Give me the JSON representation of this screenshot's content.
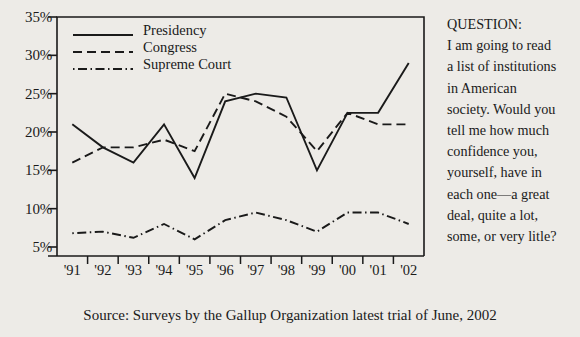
{
  "chart_data": {
    "type": "line",
    "title": "",
    "xlabel": "",
    "ylabel": "",
    "categories": [
      "'91",
      "'92",
      "'93",
      "'94",
      "'95",
      "'96",
      "'97",
      "'98",
      "'99",
      "'00",
      "'01",
      "'02"
    ],
    "ylim": [
      0,
      35
    ],
    "ytick_values": [
      5,
      10,
      15,
      20,
      25,
      30,
      35
    ],
    "ytick_labels": [
      "5%",
      "10%",
      "15%",
      "20%",
      "25%",
      "30%",
      "35%"
    ],
    "grid": false,
    "legend_position": "top-left",
    "series": [
      {
        "name": "Presidency",
        "style": "solid",
        "values": [
          21,
          18,
          16,
          21,
          14,
          24,
          25,
          24.5,
          15,
          22.5,
          22.5,
          29
        ]
      },
      {
        "name": "Congress",
        "style": "dashed",
        "values": [
          16,
          18,
          18,
          19,
          17.5,
          25,
          24,
          22,
          17.5,
          22.5,
          21,
          21
        ]
      },
      {
        "name": "Supreme Court",
        "style": "dash-dot",
        "values": [
          6.8,
          7,
          6.2,
          8,
          6,
          8.5,
          9.5,
          8.5,
          7,
          9.5,
          9.5,
          8
        ]
      }
    ]
  },
  "question": {
    "heading": "QUESTION:",
    "lines": [
      "I am going to read",
      "a list of institutions",
      "in American",
      "society. Would you",
      "tell me how much",
      "confidence you,",
      "yourself, have in",
      "each one—a great",
      "deal, quite a lot,",
      "some, or very litle?"
    ]
  },
  "source": {
    "text": "Source: Surveys by the Gallup Organization latest trial of June, 2002"
  },
  "style": {
    "ink": "#1a1a1a",
    "paper": "#edebe7"
  }
}
